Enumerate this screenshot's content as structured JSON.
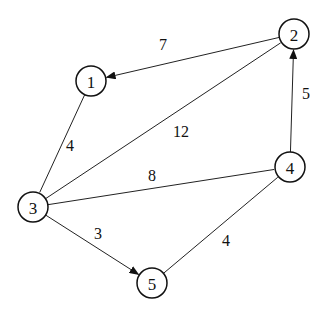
{
  "graph": {
    "nodes": [
      {
        "id": "1",
        "label": "1",
        "x": 91,
        "y": 81
      },
      {
        "id": "2",
        "label": "2",
        "x": 294,
        "y": 34
      },
      {
        "id": "3",
        "label": "3",
        "x": 33,
        "y": 207
      },
      {
        "id": "4",
        "label": "4",
        "x": 290,
        "y": 167
      },
      {
        "id": "5",
        "label": "5",
        "x": 152,
        "y": 283
      }
    ],
    "edges": [
      {
        "from": "2",
        "to": "1",
        "weight": "7",
        "directed": true,
        "label_x": 163,
        "label_y": 44
      },
      {
        "from": "1",
        "to": "3",
        "weight": "4",
        "directed": false,
        "label_x": 70,
        "label_y": 145
      },
      {
        "from": "3",
        "to": "2",
        "weight": "12",
        "directed": false,
        "label_x": 181,
        "label_y": 131
      },
      {
        "from": "4",
        "to": "2",
        "weight": "5",
        "directed": true,
        "label_x": 306,
        "label_y": 93
      },
      {
        "from": "3",
        "to": "4",
        "weight": "8",
        "directed": false,
        "label_x": 152,
        "label_y": 175
      },
      {
        "from": "3",
        "to": "5",
        "weight": "3",
        "directed": true,
        "label_x": 98,
        "label_y": 233
      },
      {
        "from": "5",
        "to": "4",
        "weight": "4",
        "directed": false,
        "label_x": 226,
        "label_y": 240
      }
    ]
  }
}
